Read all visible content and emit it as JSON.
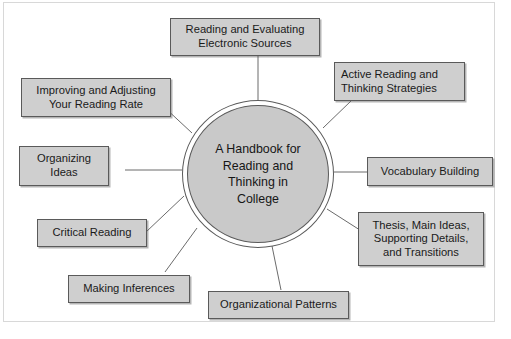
{
  "diagram": {
    "type": "hub-and-spoke concept map",
    "center": {
      "label": "A Handbook for\nReading and\nThinking in\nCollege"
    },
    "colors": {
      "node_fill": "#cfcfcf",
      "node_border": "#5a5a5a",
      "center_fill": "#c9c9c9",
      "center_border": "#5a5a5a",
      "connector": "#6b6b6b",
      "page_background": "#ffffff",
      "text": "#1a1a1a"
    },
    "nodes": [
      {
        "id": "reading-evaluating-electronic-sources",
        "label": "Reading and Evaluating\nElectronic Sources",
        "position": "top"
      },
      {
        "id": "active-reading-thinking-strategies",
        "label": "Active Reading and\nThinking Strategies",
        "position": "top-right"
      },
      {
        "id": "vocabulary-building",
        "label": "Vocabulary Building",
        "position": "right"
      },
      {
        "id": "thesis-main-ideas-supporting-details-transitions",
        "label": "Thesis, Main Ideas,\nSupporting Details,\nand Transitions",
        "position": "bottom-right"
      },
      {
        "id": "organizational-patterns",
        "label": "Organizational Patterns",
        "position": "bottom"
      },
      {
        "id": "making-inferences",
        "label": "Making Inferences",
        "position": "bottom-left"
      },
      {
        "id": "critical-reading",
        "label": "Critical Reading",
        "position": "left-lower"
      },
      {
        "id": "organizing-ideas",
        "label": "Organizing\nIdeas",
        "position": "left"
      },
      {
        "id": "improving-adjusting-reading-rate",
        "label": "Improving and Adjusting\nYour Reading Rate",
        "position": "top-left"
      }
    ]
  }
}
